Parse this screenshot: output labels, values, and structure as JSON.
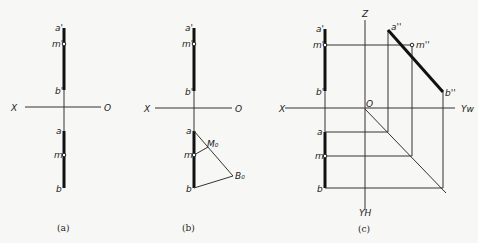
{
  "figure": {
    "panels": [
      {
        "id": "a",
        "caption": "(a)",
        "labels": {
          "a_prime": "a'",
          "m_prime": "m'",
          "b_prime": "b'",
          "x_axis": "X",
          "origin": "O",
          "a": "a",
          "m": "m",
          "b": "b"
        }
      },
      {
        "id": "b",
        "caption": "(b)",
        "labels": {
          "a_prime": "a'",
          "m_prime": "m'",
          "b_prime": "b'",
          "x_axis": "X",
          "origin": "O",
          "a": "a",
          "m": "m",
          "b": "b",
          "M0": "M₀",
          "B0": "B₀"
        }
      },
      {
        "id": "c",
        "caption": "(c)",
        "labels": {
          "a_prime": "a'",
          "m_prime": "m'",
          "b_prime": "b'",
          "x_axis": "X",
          "origin": "O",
          "z_axis": "Z",
          "yw_axis": "Yw",
          "yh_axis": "YH",
          "a": "a",
          "m": "m",
          "b": "b",
          "a_dprime": "a''",
          "m_dprime": "m''",
          "b_dprime": "b''"
        }
      }
    ],
    "colors": {
      "background": "#f7f7f5",
      "line": "#111111"
    }
  }
}
